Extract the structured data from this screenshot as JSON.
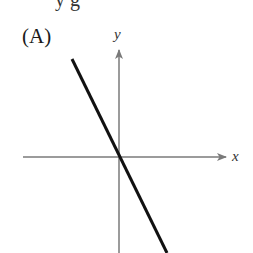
{
  "top_clipped_text": "y g",
  "panel": {
    "label": "(A)"
  },
  "axes": {
    "x_label": "x",
    "y_label": "y",
    "axis_color": "#7a7a7a"
  },
  "line": {
    "color": "#111111",
    "slope_sign": "negative",
    "passes_through_origin": true
  }
}
